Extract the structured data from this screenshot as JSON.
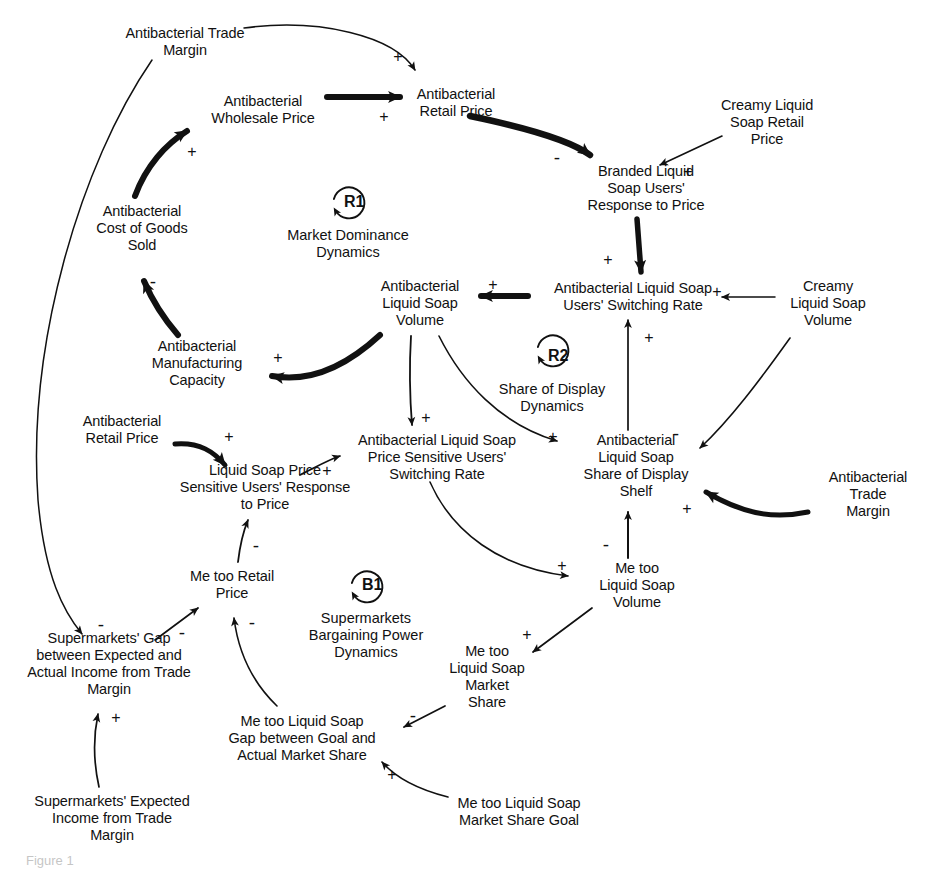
{
  "diagram": {
    "type": "causal-loop-diagram",
    "background": "#ffffff",
    "ink": "#111111",
    "width": 943,
    "height": 870
  },
  "nodes": [
    {
      "id": "antibac-trade-margin-top",
      "label": "Antibacterial Trade\nMargin",
      "x": 185,
      "y": 42
    },
    {
      "id": "antibac-wholesale-price",
      "label": "Antibacterial\nWholesale Price",
      "x": 263,
      "y": 110
    },
    {
      "id": "antibac-retail-price-top",
      "label": "Antibacterial\nRetail Price",
      "x": 456,
      "y": 103
    },
    {
      "id": "creamy-retail-price",
      "label": "Creamy Liquid\nSoap Retail\nPrice",
      "x": 767,
      "y": 122
    },
    {
      "id": "branded-response-price",
      "label": "Branded Liquid\nSoap Users'\nResponse to Price",
      "x": 646,
      "y": 188
    },
    {
      "id": "antibac-cogs",
      "label": "Antibacterial\nCost of Goods\nSold",
      "x": 142,
      "y": 228
    },
    {
      "id": "antibac-volume",
      "label": "Antibacterial\nLiquid Soap\nVolume",
      "x": 420,
      "y": 303
    },
    {
      "id": "antibac-switching-rate",
      "label": "Antibacterial Liquid Soap\nUsers' Switching Rate",
      "x": 633,
      "y": 297
    },
    {
      "id": "creamy-volume",
      "label": "Creamy\nLiquid Soap\nVolume",
      "x": 828,
      "y": 303
    },
    {
      "id": "antibac-mfg-capacity",
      "label": "Antibacterial\nManufacturing\nCapacity",
      "x": 197,
      "y": 363
    },
    {
      "id": "antibac-retail-price-mid",
      "label": "Antibacterial\nRetail Price",
      "x": 122,
      "y": 430
    },
    {
      "id": "antibac-price-sens-switch",
      "label": "Antibacterial Liquid Soap\nPrice Sensitive Users'\nSwitching Rate",
      "x": 437,
      "y": 457
    },
    {
      "id": "antibac-share-display",
      "label": "Antibacterial\nLiquid Soap\nShare of Display\nShelf",
      "x": 636,
      "y": 466
    },
    {
      "id": "price-sens-response",
      "label": "Liquid Soap Price\nSensitive Users' Response\nto Price",
      "x": 265,
      "y": 487
    },
    {
      "id": "antibac-trade-margin-right",
      "label": "Antibacterial Trade\nMargin",
      "x": 868,
      "y": 494
    },
    {
      "id": "metoo-volume",
      "label": "Me too\nLiquid Soap\nVolume",
      "x": 637,
      "y": 585
    },
    {
      "id": "metoo-retail-price",
      "label": "Me too Retail\nPrice",
      "x": 232,
      "y": 585
    },
    {
      "id": "metoo-market-share",
      "label": "Me too\nLiquid Soap\nMarket\nShare",
      "x": 487,
      "y": 677
    },
    {
      "id": "supermarkets-gap",
      "label": "Supermarkets' Gap\nbetween Expected and\nActual Income from Trade\nMargin",
      "x": 109,
      "y": 664
    },
    {
      "id": "metoo-gap-goal",
      "label": "Me too Liquid Soap\nGap between Goal and\nActual Market Share",
      "x": 302,
      "y": 738
    },
    {
      "id": "supermarkets-expected",
      "label": "Supermarkets' Expected\nIncome from Trade\nMargin",
      "x": 112,
      "y": 818
    },
    {
      "id": "metoo-share-goal",
      "label": "Me too Liquid Soap\nMarket Share Goal",
      "x": 519,
      "y": 812
    }
  ],
  "loops": [
    {
      "id": "R1",
      "code": "R1",
      "label": "Market Dominance\nDynamics",
      "x": 348,
      "y": 208
    },
    {
      "id": "R2",
      "code": "R2",
      "label": "Share of Display\nDynamics",
      "x": 552,
      "y": 362
    },
    {
      "id": "B1",
      "code": "B1",
      "label": "Supermarkets\nBargaining Power\nDynamics",
      "x": 366,
      "y": 602
    }
  ],
  "links": [
    {
      "id": "trade-margin-to-retail-price",
      "from": "antibac-trade-margin-top",
      "to": "antibac-retail-price-top",
      "polarity": "+",
      "weight": "thin"
    },
    {
      "id": "wholesale-to-retail-price",
      "from": "antibac-wholesale-price",
      "to": "antibac-retail-price-top",
      "polarity": "+",
      "weight": "thick"
    },
    {
      "id": "cogs-to-wholesale-price",
      "from": "antibac-cogs",
      "to": "antibac-wholesale-price",
      "polarity": "+",
      "weight": "thick"
    },
    {
      "id": "retail-price-to-branded-resp",
      "from": "antibac-retail-price-top",
      "to": "branded-response-price",
      "polarity": "-",
      "weight": "thick"
    },
    {
      "id": "creamy-price-to-branded-resp",
      "from": "creamy-retail-price",
      "to": "branded-response-price",
      "polarity": "+",
      "weight": "thin"
    },
    {
      "id": "branded-resp-to-switching",
      "from": "branded-response-price",
      "to": "antibac-switching-rate",
      "polarity": "+",
      "weight": "thick"
    },
    {
      "id": "switching-to-antibac-volume",
      "from": "antibac-switching-rate",
      "to": "antibac-volume",
      "polarity": "+",
      "weight": "thick"
    },
    {
      "id": "creamy-volume-to-switching",
      "from": "creamy-volume",
      "to": "antibac-switching-rate",
      "polarity": "+",
      "weight": "thin"
    },
    {
      "id": "share-display-to-switching",
      "from": "antibac-share-display",
      "to": "antibac-switching-rate",
      "polarity": "+",
      "weight": "thin"
    },
    {
      "id": "creamy-volume-to-share-display",
      "from": "creamy-volume",
      "to": "antibac-share-display",
      "polarity": "-",
      "weight": "thin"
    },
    {
      "id": "trade-margin-to-share-display",
      "from": "antibac-trade-margin-right",
      "to": "antibac-share-display",
      "polarity": "+",
      "weight": "thick"
    },
    {
      "id": "antibac-volume-to-mfg-capacity",
      "from": "antibac-volume",
      "to": "antibac-mfg-capacity",
      "polarity": "+",
      "weight": "thick"
    },
    {
      "id": "mfg-capacity-to-cogs",
      "from": "antibac-mfg-capacity",
      "to": "antibac-cogs",
      "polarity": "-",
      "weight": "thick"
    },
    {
      "id": "antibac-volume-to-price-sens",
      "from": "antibac-volume",
      "to": "antibac-price-sens-switch",
      "polarity": "+",
      "weight": "thin"
    },
    {
      "id": "antibac-volume-to-share-disp",
      "from": "antibac-volume",
      "to": "antibac-share-display",
      "polarity": "+",
      "weight": "thin"
    },
    {
      "id": "retail-price-mid-to-response",
      "from": "antibac-retail-price-mid",
      "to": "price-sens-response",
      "polarity": "+",
      "weight": "thick"
    },
    {
      "id": "response-to-price-sens-switch",
      "from": "price-sens-response",
      "to": "antibac-price-sens-switch",
      "polarity": "+",
      "weight": "thin"
    },
    {
      "id": "price-sens-switch-to-metoo-vol",
      "from": "antibac-price-sens-switch",
      "to": "metoo-volume",
      "polarity": "+",
      "weight": "thin"
    },
    {
      "id": "metoo-volume-to-share-display",
      "from": "metoo-volume",
      "to": "antibac-share-display",
      "polarity": "-",
      "weight": "thin"
    },
    {
      "id": "metoo-volume-to-market-share",
      "from": "metoo-volume",
      "to": "metoo-market-share",
      "polarity": "+",
      "weight": "thin"
    },
    {
      "id": "market-share-to-gap",
      "from": "metoo-market-share",
      "to": "metoo-gap-goal",
      "polarity": "-",
      "weight": "thin"
    },
    {
      "id": "share-goal-to-gap",
      "from": "metoo-share-goal",
      "to": "metoo-gap-goal",
      "polarity": "+",
      "weight": "thin"
    },
    {
      "id": "gap-to-metoo-retail-price",
      "from": "metoo-gap-goal",
      "to": "metoo-retail-price",
      "polarity": "-",
      "weight": "thin"
    },
    {
      "id": "metoo-retail-to-response",
      "from": "metoo-retail-price",
      "to": "price-sens-response",
      "polarity": "-",
      "weight": "thin"
    },
    {
      "id": "supermarkets-gap-to-metoo-rp",
      "from": "supermarkets-gap",
      "to": "metoo-retail-price",
      "polarity": "-",
      "weight": "thin"
    },
    {
      "id": "expected-income-to-gap",
      "from": "supermarkets-expected",
      "to": "supermarkets-gap",
      "polarity": "+",
      "weight": "thin"
    },
    {
      "id": "trade-margin-top-to-sm-gap",
      "from": "antibac-trade-margin-top",
      "to": "supermarkets-gap",
      "polarity": "-",
      "weight": "thin"
    }
  ],
  "polarity_markers": [
    {
      "id": "p-trade-margin-retail",
      "sign": "+",
      "x": 398,
      "y": 57
    },
    {
      "id": "p-wholesale-retail",
      "sign": "+",
      "x": 384,
      "y": 117
    },
    {
      "id": "p-cogs-wholesale",
      "sign": "+",
      "x": 192,
      "y": 152
    },
    {
      "id": "p-retail-branded",
      "sign": "-",
      "x": 557,
      "y": 157
    },
    {
      "id": "p-creamy-branded",
      "sign": "+",
      "x": 688,
      "y": 172
    },
    {
      "id": "p-branded-switching",
      "sign": "+",
      "x": 608,
      "y": 260
    },
    {
      "id": "p-switching-antibacvol",
      "sign": "+",
      "x": 493,
      "y": 285
    },
    {
      "id": "p-creamyvol-switching",
      "sign": "+",
      "x": 717,
      "y": 292
    },
    {
      "id": "p-sharedisp-switching",
      "sign": "+",
      "x": 630,
      "y": 338
    },
    {
      "id": "p-antibacvol-mfg",
      "sign": "+",
      "x": 278,
      "y": 358
    },
    {
      "id": "p-mfg-cogs",
      "sign": "-",
      "x": 145,
      "y": 281
    },
    {
      "id": "p-antibacvol-pricesens",
      "sign": "+",
      "x": 426,
      "y": 418
    },
    {
      "id": "p-antibacvol-sharedisp",
      "sign": "+",
      "x": 553,
      "y": 437
    },
    {
      "id": "p-creamyvol-sharedisp",
      "sign": "-",
      "x": 676,
      "y": 433
    },
    {
      "id": "p-retailmid-response",
      "sign": "+",
      "x": 229,
      "y": 437
    },
    {
      "id": "p-response-pricesens",
      "sign": "+",
      "x": 327,
      "y": 471
    },
    {
      "id": "p-trademargin-sharedisp",
      "sign": "+",
      "x": 687,
      "y": 509
    },
    {
      "id": "p-metoovol-sharedisp",
      "sign": "-",
      "x": 606,
      "y": 544
    },
    {
      "id": "p-pricesens-metoovol",
      "sign": "+",
      "x": 562,
      "y": 566
    },
    {
      "id": "p-metoovol-marketshare",
      "sign": "+",
      "x": 527,
      "y": 635
    },
    {
      "id": "p-gap-metoorp",
      "sign": "-",
      "x": 252,
      "y": 625
    },
    {
      "id": "p-metoorp-response",
      "sign": "-",
      "x": 256,
      "y": 545
    },
    {
      "id": "p-smgap-metoorp",
      "sign": "-",
      "x": 182,
      "y": 632
    },
    {
      "id": "p-trademargin-smgap",
      "sign": "-",
      "x": 101,
      "y": 624
    },
    {
      "id": "p-expected-smgap",
      "sign": "+",
      "x": 116,
      "y": 718
    },
    {
      "id": "p-marketshare-gap",
      "sign": "-",
      "x": 413,
      "y": 718
    },
    {
      "id": "p-sharegoal-gap",
      "sign": "+",
      "x": 392,
      "y": 775
    }
  ],
  "caption": {
    "text": "Figure 1"
  }
}
